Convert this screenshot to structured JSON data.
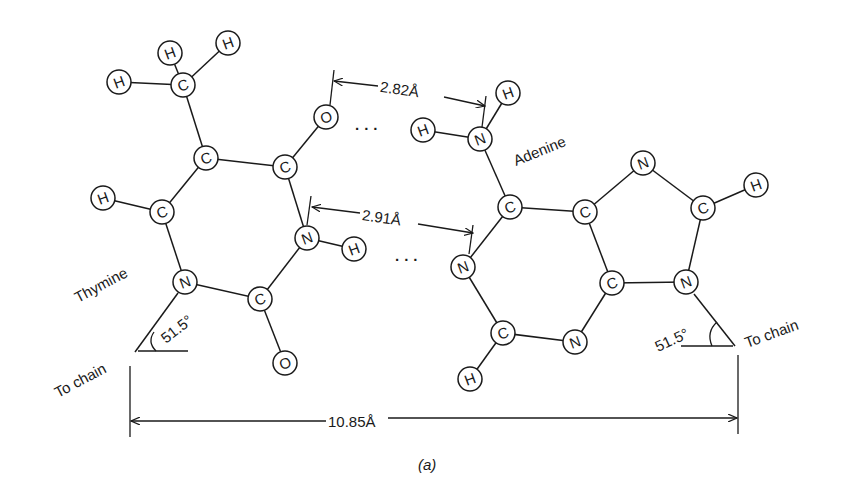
{
  "figure": {
    "caption": "(a)",
    "labels": {
      "thymine": "Thymine",
      "adenine": "Adenine",
      "to_chain_left": "To chain",
      "to_chain_right": "To chain",
      "angle_left": "51.5°",
      "angle_right": "51.5°",
      "hbond_top": "2.82Å",
      "hbond_middle": "2.91Å",
      "c1_distance": "10.85Å",
      "dots_top": "· · ·",
      "dots_middle": "· · ·"
    },
    "colors": {
      "ink": "#1a1a1a",
      "background": "#ffffff"
    }
  },
  "atoms": [
    {
      "id": "t_h1",
      "el": "H",
      "x": 119,
      "y": 82
    },
    {
      "id": "t_h2",
      "el": "H",
      "x": 170,
      "y": 53
    },
    {
      "id": "t_h3",
      "el": "H",
      "x": 228,
      "y": 43
    },
    {
      "id": "t_cm",
      "el": "C",
      "x": 183,
      "y": 85
    },
    {
      "id": "t_c5",
      "el": "C",
      "x": 206,
      "y": 158
    },
    {
      "id": "t_c4",
      "el": "C",
      "x": 285,
      "y": 167
    },
    {
      "id": "t_o4",
      "el": "O",
      "x": 326,
      "y": 117
    },
    {
      "id": "t_h6",
      "el": "H",
      "x": 103,
      "y": 198
    },
    {
      "id": "t_c6",
      "el": "C",
      "x": 162,
      "y": 212
    },
    {
      "id": "t_n3",
      "el": "N",
      "x": 307,
      "y": 238
    },
    {
      "id": "t_h3n",
      "el": "H",
      "x": 354,
      "y": 249
    },
    {
      "id": "t_n1",
      "el": "N",
      "x": 185,
      "y": 282
    },
    {
      "id": "t_c2",
      "el": "C",
      "x": 260,
      "y": 299
    },
    {
      "id": "t_o2",
      "el": "O",
      "x": 285,
      "y": 363
    },
    {
      "id": "a_h6a",
      "el": "H",
      "x": 508,
      "y": 93
    },
    {
      "id": "a_h6b",
      "el": "H",
      "x": 423,
      "y": 130
    },
    {
      "id": "a_n6",
      "el": "N",
      "x": 480,
      "y": 139
    },
    {
      "id": "a_c6",
      "el": "C",
      "x": 510,
      "y": 207
    },
    {
      "id": "a_n7",
      "el": "N",
      "x": 643,
      "y": 163
    },
    {
      "id": "a_h8",
      "el": "H",
      "x": 756,
      "y": 185
    },
    {
      "id": "a_c8",
      "el": "C",
      "x": 703,
      "y": 208
    },
    {
      "id": "a_c5",
      "el": "C",
      "x": 585,
      "y": 212
    },
    {
      "id": "a_n1",
      "el": "N",
      "x": 463,
      "y": 267
    },
    {
      "id": "a_c4",
      "el": "C",
      "x": 612,
      "y": 283
    },
    {
      "id": "a_n9",
      "el": "N",
      "x": 686,
      "y": 282
    },
    {
      "id": "a_c2",
      "el": "C",
      "x": 503,
      "y": 333
    },
    {
      "id": "a_n3",
      "el": "N",
      "x": 575,
      "y": 342
    },
    {
      "id": "a_h2",
      "el": "H",
      "x": 470,
      "y": 379
    }
  ],
  "bonds": [
    [
      "t_h1",
      "t_cm"
    ],
    [
      "t_h2",
      "t_cm"
    ],
    [
      "t_h3",
      "t_cm"
    ],
    [
      "t_cm",
      "t_c5"
    ],
    [
      "t_c5",
      "t_c4"
    ],
    [
      "t_c4",
      "t_o4"
    ],
    [
      "t_c5",
      "t_c6"
    ],
    [
      "t_h6",
      "t_c6"
    ],
    [
      "t_c6",
      "t_n1"
    ],
    [
      "t_c4",
      "t_n3"
    ],
    [
      "t_n3",
      "t_h3n"
    ],
    [
      "t_n3",
      "t_c2"
    ],
    [
      "t_n1",
      "t_c2"
    ],
    [
      "t_c2",
      "t_o2"
    ],
    [
      "a_h6a",
      "a_n6"
    ],
    [
      "a_h6b",
      "a_n6"
    ],
    [
      "a_n6",
      "a_c6"
    ],
    [
      "a_c6",
      "a_c5"
    ],
    [
      "a_c6",
      "a_n1"
    ],
    [
      "a_c5",
      "a_n7"
    ],
    [
      "a_n7",
      "a_c8"
    ],
    [
      "a_c8",
      "a_h8"
    ],
    [
      "a_c8",
      "a_n9"
    ],
    [
      "a_n9",
      "a_c4"
    ],
    [
      "a_c5",
      "a_c4"
    ],
    [
      "a_c4",
      "a_n3"
    ],
    [
      "a_n3",
      "a_c2"
    ],
    [
      "a_c2",
      "a_n1"
    ],
    [
      "a_c2",
      "a_h2"
    ]
  ]
}
